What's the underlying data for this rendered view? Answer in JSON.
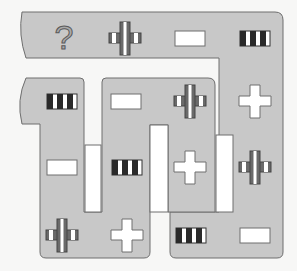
{
  "puzzle": {
    "title": "Symbol path sequence puzzle",
    "colors": {
      "path_fill": "#c8c8c8",
      "path_stroke": "#6e6e6e",
      "background": "#f7f7f6",
      "symbol_dark": "#2a2a2a",
      "symbol_mid": "#6a6a6a",
      "symbol_white": "#ffffff",
      "question_fill": "#a9a9a9"
    },
    "question_mark": "?",
    "symbol_types": {
      "question": "question-mark",
      "striped_cross": "striped-cross",
      "white_rect": "white-rectangle",
      "bars": "black-white-bars",
      "white_cross": "white-cross"
    },
    "cells": [
      {
        "row": 1,
        "col": 1,
        "x": 64,
        "y": 38,
        "symbol": "question"
      },
      {
        "row": 1,
        "col": 2,
        "x": 125,
        "y": 38,
        "symbol": "striped_cross"
      },
      {
        "row": 1,
        "col": 3,
        "x": 190,
        "y": 38,
        "symbol": "white_rect"
      },
      {
        "row": 1,
        "col": 4,
        "x": 255,
        "y": 38,
        "symbol": "bars"
      },
      {
        "row": 2,
        "col": 1,
        "x": 62,
        "y": 101,
        "symbol": "bars"
      },
      {
        "row": 2,
        "col": 2,
        "x": 126,
        "y": 101,
        "symbol": "white_rect"
      },
      {
        "row": 2,
        "col": 3,
        "x": 190,
        "y": 101,
        "symbol": "striped_cross"
      },
      {
        "row": 2,
        "col": 4,
        "x": 255,
        "y": 101,
        "symbol": "white_cross"
      },
      {
        "row": 3,
        "col": 1,
        "x": 62,
        "y": 167,
        "symbol": "white_rect"
      },
      {
        "row": 3,
        "col": 2,
        "x": 127,
        "y": 167,
        "symbol": "bars"
      },
      {
        "row": 3,
        "col": 3,
        "x": 190,
        "y": 167,
        "symbol": "white_cross"
      },
      {
        "row": 3,
        "col": 4,
        "x": 255,
        "y": 167,
        "symbol": "striped_cross"
      },
      {
        "row": 4,
        "col": 1,
        "x": 62,
        "y": 235,
        "symbol": "striped_cross"
      },
      {
        "row": 4,
        "col": 2,
        "x": 127,
        "y": 235,
        "symbol": "white_cross"
      },
      {
        "row": 4,
        "col": 3,
        "x": 191,
        "y": 235,
        "symbol": "bars"
      },
      {
        "row": 4,
        "col": 4,
        "x": 255,
        "y": 235,
        "symbol": "white_rect"
      }
    ]
  }
}
